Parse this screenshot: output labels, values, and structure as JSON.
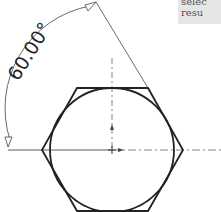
{
  "diagram": {
    "angle_dimension": "60.00°",
    "shape": "hexagon inscribed around circle"
  },
  "tooltip": {
    "line1": "selec",
    "line2": "resu"
  }
}
